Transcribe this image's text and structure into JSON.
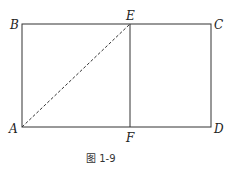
{
  "figure": {
    "caption": "图 1-9",
    "points": {
      "A": {
        "label": "A",
        "x": 22,
        "y": 127
      },
      "B": {
        "label": "B",
        "x": 22,
        "y": 24
      },
      "C": {
        "label": "C",
        "x": 211,
        "y": 24
      },
      "D": {
        "label": "D",
        "x": 211,
        "y": 127
      },
      "E": {
        "label": "E",
        "x": 130,
        "y": 24
      },
      "F": {
        "label": "F",
        "x": 130,
        "y": 127
      }
    },
    "segments": [
      {
        "from": "A",
        "to": "B",
        "style": "solid"
      },
      {
        "from": "B",
        "to": "C",
        "style": "solid"
      },
      {
        "from": "C",
        "to": "D",
        "style": "solid"
      },
      {
        "from": "D",
        "to": "A",
        "style": "solid"
      },
      {
        "from": "E",
        "to": "F",
        "style": "solid"
      },
      {
        "from": "A",
        "to": "E",
        "style": "dashed"
      }
    ],
    "line_color": "#333333"
  }
}
